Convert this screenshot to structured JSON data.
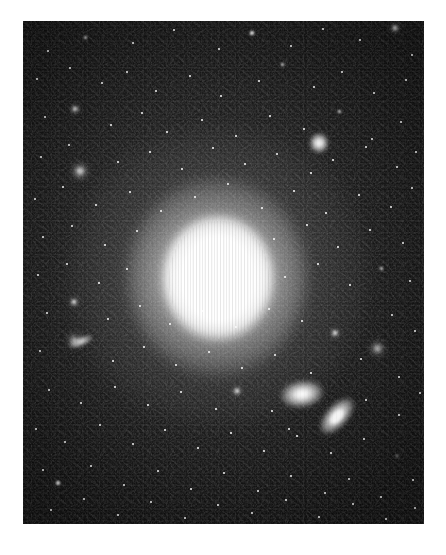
{
  "image": {
    "kind": "astronomical-photograph",
    "subject": "bright elliptical galaxy with companion galaxies in a dense star field",
    "canvas": {
      "width": 446,
      "height": 555,
      "background_color": "#ffffff"
    },
    "plate": {
      "x": 23,
      "y": 21,
      "width": 401,
      "height": 503,
      "background_color": "#121212",
      "sky_color": "#232323",
      "noise": "heavy photographic grain with vertical CCD column striping"
    },
    "colors": {
      "paper_white": "#ffffff",
      "sky_dark": "#121212",
      "sky_mid": "#2e2e2e",
      "star_white": "#ffffff",
      "core_white": "#ffffff"
    }
  },
  "objects": {
    "primary_galaxy": {
      "name": "central-elliptical-galaxy",
      "type": "elliptical",
      "center_x": 195,
      "center_y": 258,
      "core_radius": 44,
      "halo_radius": 150,
      "peak_brightness": "saturated",
      "artifact": "vertical saturation bleed stripes across core"
    },
    "companions": [
      {
        "name": "companion-galaxy-upper",
        "type": "lenticular",
        "center_x": 279,
        "center_y": 373,
        "semi_major": 21,
        "semi_minor": 13,
        "angle_deg": -8
      },
      {
        "name": "companion-galaxy-lower",
        "type": "edge-on-spiral",
        "center_x": 314,
        "center_y": 395,
        "semi_major": 22,
        "semi_minor": 11,
        "angle_deg": -48
      },
      {
        "name": "companion-galaxy-left-edge",
        "type": "edge-on",
        "center_x": 58,
        "center_y": 320,
        "semi_major": 12,
        "semi_minor": 5,
        "angle_deg": -22
      },
      {
        "name": "companion-galaxy-upper-right",
        "type": "compact",
        "center_x": 296,
        "center_y": 122,
        "semi_major": 9,
        "semi_minor": 10,
        "angle_deg": 0
      }
    ]
  },
  "chart_data": {
    "type": "scatter",
    "title": "",
    "xlabel": "",
    "ylabel": "",
    "xlim": [
      0,
      401
    ],
    "ylim": [
      0,
      503
    ],
    "grid": false,
    "legend": "none",
    "note": "Star field point sources. x,y are plate-relative pixels; r is rendered radius in px; b is brightness class 1-4.",
    "stars": [
      {
        "x": 25,
        "y": 30,
        "r": 1.2,
        "b": 1
      },
      {
        "x": 62,
        "y": 16,
        "r": 1.5,
        "b": 2
      },
      {
        "x": 110,
        "y": 22,
        "r": 1.1,
        "b": 1
      },
      {
        "x": 151,
        "y": 9,
        "r": 1.3,
        "b": 1
      },
      {
        "x": 196,
        "y": 28,
        "r": 1.0,
        "b": 1
      },
      {
        "x": 229,
        "y": 12,
        "r": 1.6,
        "b": 2
      },
      {
        "x": 268,
        "y": 25,
        "r": 1.2,
        "b": 1
      },
      {
        "x": 300,
        "y": 8,
        "r": 1.1,
        "b": 1
      },
      {
        "x": 337,
        "y": 19,
        "r": 1.4,
        "b": 1
      },
      {
        "x": 372,
        "y": 7,
        "r": 2.0,
        "b": 3
      },
      {
        "x": 389,
        "y": 34,
        "r": 1.2,
        "b": 1
      },
      {
        "x": 14,
        "y": 58,
        "r": 1.3,
        "b": 1
      },
      {
        "x": 47,
        "y": 47,
        "r": 1.1,
        "b": 1
      },
      {
        "x": 79,
        "y": 62,
        "r": 1.0,
        "b": 1
      },
      {
        "x": 104,
        "y": 51,
        "r": 1.4,
        "b": 1
      },
      {
        "x": 133,
        "y": 70,
        "r": 1.2,
        "b": 1
      },
      {
        "x": 167,
        "y": 55,
        "r": 1.1,
        "b": 1
      },
      {
        "x": 198,
        "y": 75,
        "r": 1.3,
        "b": 1
      },
      {
        "x": 236,
        "y": 60,
        "r": 1.0,
        "b": 1
      },
      {
        "x": 259,
        "y": 43,
        "r": 1.5,
        "b": 2
      },
      {
        "x": 291,
        "y": 66,
        "r": 1.2,
        "b": 1
      },
      {
        "x": 319,
        "y": 51,
        "r": 1.1,
        "b": 1
      },
      {
        "x": 351,
        "y": 72,
        "r": 1.3,
        "b": 1
      },
      {
        "x": 383,
        "y": 59,
        "r": 1.0,
        "b": 1
      },
      {
        "x": 22,
        "y": 96,
        "r": 1.1,
        "b": 1
      },
      {
        "x": 52,
        "y": 88,
        "r": 2.1,
        "b": 3
      },
      {
        "x": 88,
        "y": 104,
        "r": 1.2,
        "b": 1
      },
      {
        "x": 119,
        "y": 92,
        "r": 1.4,
        "b": 1
      },
      {
        "x": 144,
        "y": 111,
        "r": 1.0,
        "b": 1
      },
      {
        "x": 179,
        "y": 99,
        "r": 1.2,
        "b": 1
      },
      {
        "x": 213,
        "y": 115,
        "r": 1.1,
        "b": 1
      },
      {
        "x": 247,
        "y": 95,
        "r": 1.3,
        "b": 1
      },
      {
        "x": 281,
        "y": 108,
        "r": 1.0,
        "b": 1
      },
      {
        "x": 316,
        "y": 90,
        "r": 1.5,
        "b": 2
      },
      {
        "x": 349,
        "y": 118,
        "r": 1.2,
        "b": 1
      },
      {
        "x": 378,
        "y": 101,
        "r": 1.1,
        "b": 1
      },
      {
        "x": 18,
        "y": 136,
        "r": 1.3,
        "b": 1
      },
      {
        "x": 46,
        "y": 124,
        "r": 1.1,
        "b": 1
      },
      {
        "x": 57,
        "y": 150,
        "r": 2.6,
        "b": 4
      },
      {
        "x": 95,
        "y": 141,
        "r": 1.2,
        "b": 1
      },
      {
        "x": 127,
        "y": 131,
        "r": 1.0,
        "b": 1
      },
      {
        "x": 159,
        "y": 148,
        "r": 1.3,
        "b": 1
      },
      {
        "x": 190,
        "y": 127,
        "r": 1.1,
        "b": 1
      },
      {
        "x": 222,
        "y": 143,
        "r": 1.2,
        "b": 1
      },
      {
        "x": 254,
        "y": 133,
        "r": 1.0,
        "b": 1
      },
      {
        "x": 288,
        "y": 152,
        "r": 1.4,
        "b": 1
      },
      {
        "x": 310,
        "y": 139,
        "r": 1.1,
        "b": 1
      },
      {
        "x": 343,
        "y": 126,
        "r": 1.3,
        "b": 1
      },
      {
        "x": 374,
        "y": 146,
        "r": 1.0,
        "b": 1
      },
      {
        "x": 393,
        "y": 131,
        "r": 1.2,
        "b": 1
      },
      {
        "x": 12,
        "y": 178,
        "r": 1.1,
        "b": 1
      },
      {
        "x": 40,
        "y": 166,
        "r": 1.3,
        "b": 1
      },
      {
        "x": 73,
        "y": 184,
        "r": 1.0,
        "b": 1
      },
      {
        "x": 107,
        "y": 171,
        "r": 1.2,
        "b": 1
      },
      {
        "x": 138,
        "y": 190,
        "r": 1.1,
        "b": 1
      },
      {
        "x": 172,
        "y": 176,
        "r": 1.0,
        "b": 1
      },
      {
        "x": 205,
        "y": 163,
        "r": 1.2,
        "b": 1
      },
      {
        "x": 239,
        "y": 187,
        "r": 1.1,
        "b": 1
      },
      {
        "x": 271,
        "y": 170,
        "r": 1.4,
        "b": 1
      },
      {
        "x": 303,
        "y": 192,
        "r": 1.0,
        "b": 1
      },
      {
        "x": 336,
        "y": 174,
        "r": 1.3,
        "b": 1
      },
      {
        "x": 368,
        "y": 186,
        "r": 1.1,
        "b": 1
      },
      {
        "x": 389,
        "y": 167,
        "r": 1.2,
        "b": 1
      },
      {
        "x": 20,
        "y": 216,
        "r": 1.2,
        "b": 1
      },
      {
        "x": 49,
        "y": 205,
        "r": 1.0,
        "b": 1
      },
      {
        "x": 82,
        "y": 224,
        "r": 1.3,
        "b": 1
      },
      {
        "x": 114,
        "y": 210,
        "r": 1.1,
        "b": 1
      },
      {
        "x": 251,
        "y": 218,
        "r": 1.2,
        "b": 1
      },
      {
        "x": 284,
        "y": 204,
        "r": 1.0,
        "b": 1
      },
      {
        "x": 315,
        "y": 226,
        "r": 1.4,
        "b": 1
      },
      {
        "x": 347,
        "y": 209,
        "r": 1.1,
        "b": 1
      },
      {
        "x": 380,
        "y": 222,
        "r": 1.3,
        "b": 1
      },
      {
        "x": 15,
        "y": 254,
        "r": 1.1,
        "b": 1
      },
      {
        "x": 44,
        "y": 243,
        "r": 1.2,
        "b": 1
      },
      {
        "x": 76,
        "y": 262,
        "r": 1.0,
        "b": 1
      },
      {
        "x": 104,
        "y": 248,
        "r": 1.3,
        "b": 1
      },
      {
        "x": 262,
        "y": 256,
        "r": 1.1,
        "b": 1
      },
      {
        "x": 295,
        "y": 243,
        "r": 1.2,
        "b": 1
      },
      {
        "x": 327,
        "y": 264,
        "r": 1.0,
        "b": 1
      },
      {
        "x": 358,
        "y": 247,
        "r": 1.5,
        "b": 2
      },
      {
        "x": 387,
        "y": 260,
        "r": 1.1,
        "b": 1
      },
      {
        "x": 24,
        "y": 292,
        "r": 1.3,
        "b": 1
      },
      {
        "x": 51,
        "y": 281,
        "r": 1.9,
        "b": 3
      },
      {
        "x": 85,
        "y": 298,
        "r": 1.0,
        "b": 1
      },
      {
        "x": 117,
        "y": 285,
        "r": 1.2,
        "b": 1
      },
      {
        "x": 147,
        "y": 303,
        "r": 1.1,
        "b": 1
      },
      {
        "x": 179,
        "y": 290,
        "r": 1.0,
        "b": 1
      },
      {
        "x": 213,
        "y": 306,
        "r": 1.3,
        "b": 1
      },
      {
        "x": 246,
        "y": 288,
        "r": 1.1,
        "b": 1
      },
      {
        "x": 279,
        "y": 300,
        "r": 1.2,
        "b": 1
      },
      {
        "x": 312,
        "y": 312,
        "r": 2.3,
        "b": 3
      },
      {
        "x": 354,
        "y": 327,
        "r": 2.5,
        "b": 4
      },
      {
        "x": 369,
        "y": 294,
        "r": 1.2,
        "b": 1
      },
      {
        "x": 392,
        "y": 310,
        "r": 1.1,
        "b": 1
      },
      {
        "x": 17,
        "y": 330,
        "r": 1.2,
        "b": 1
      },
      {
        "x": 51,
        "y": 319,
        "r": 2.4,
        "b": 4
      },
      {
        "x": 90,
        "y": 340,
        "r": 1.1,
        "b": 1
      },
      {
        "x": 121,
        "y": 326,
        "r": 1.3,
        "b": 1
      },
      {
        "x": 153,
        "y": 344,
        "r": 1.0,
        "b": 1
      },
      {
        "x": 186,
        "y": 331,
        "r": 1.2,
        "b": 1
      },
      {
        "x": 219,
        "y": 347,
        "r": 1.1,
        "b": 1
      },
      {
        "x": 252,
        "y": 334,
        "r": 1.0,
        "b": 1
      },
      {
        "x": 288,
        "y": 352,
        "r": 1.3,
        "b": 1
      },
      {
        "x": 338,
        "y": 338,
        "r": 1.1,
        "b": 1
      },
      {
        "x": 376,
        "y": 356,
        "r": 1.2,
        "b": 1
      },
      {
        "x": 26,
        "y": 369,
        "r": 1.1,
        "b": 1
      },
      {
        "x": 58,
        "y": 382,
        "r": 1.3,
        "b": 1
      },
      {
        "x": 92,
        "y": 366,
        "r": 1.0,
        "b": 1
      },
      {
        "x": 125,
        "y": 384,
        "r": 1.2,
        "b": 1
      },
      {
        "x": 158,
        "y": 371,
        "r": 1.1,
        "b": 1
      },
      {
        "x": 193,
        "y": 388,
        "r": 1.0,
        "b": 1
      },
      {
        "x": 214,
        "y": 370,
        "r": 2.0,
        "b": 3
      },
      {
        "x": 249,
        "y": 390,
        "r": 1.2,
        "b": 1
      },
      {
        "x": 266,
        "y": 408,
        "r": 1.1,
        "b": 1
      },
      {
        "x": 343,
        "y": 379,
        "r": 1.3,
        "b": 1
      },
      {
        "x": 376,
        "y": 394,
        "r": 1.0,
        "b": 1
      },
      {
        "x": 397,
        "y": 372,
        "r": 1.2,
        "b": 1
      },
      {
        "x": 13,
        "y": 408,
        "r": 1.2,
        "b": 1
      },
      {
        "x": 42,
        "y": 421,
        "r": 1.0,
        "b": 1
      },
      {
        "x": 77,
        "y": 404,
        "r": 1.3,
        "b": 1
      },
      {
        "x": 110,
        "y": 423,
        "r": 1.1,
        "b": 1
      },
      {
        "x": 142,
        "y": 409,
        "r": 1.0,
        "b": 1
      },
      {
        "x": 175,
        "y": 427,
        "r": 1.2,
        "b": 1
      },
      {
        "x": 208,
        "y": 412,
        "r": 1.1,
        "b": 1
      },
      {
        "x": 241,
        "y": 430,
        "r": 1.3,
        "b": 1
      },
      {
        "x": 274,
        "y": 415,
        "r": 1.0,
        "b": 1
      },
      {
        "x": 308,
        "y": 432,
        "r": 1.2,
        "b": 1
      },
      {
        "x": 341,
        "y": 418,
        "r": 1.1,
        "b": 1
      },
      {
        "x": 374,
        "y": 435,
        "r": 1.4,
        "b": 2
      },
      {
        "x": 20,
        "y": 449,
        "r": 1.1,
        "b": 1
      },
      {
        "x": 35,
        "y": 462,
        "r": 1.7,
        "b": 2
      },
      {
        "x": 68,
        "y": 445,
        "r": 1.2,
        "b": 1
      },
      {
        "x": 101,
        "y": 464,
        "r": 1.0,
        "b": 1
      },
      {
        "x": 135,
        "y": 450,
        "r": 1.3,
        "b": 1
      },
      {
        "x": 168,
        "y": 468,
        "r": 1.1,
        "b": 1
      },
      {
        "x": 201,
        "y": 452,
        "r": 1.0,
        "b": 1
      },
      {
        "x": 235,
        "y": 470,
        "r": 1.2,
        "b": 1
      },
      {
        "x": 268,
        "y": 455,
        "r": 1.1,
        "b": 1
      },
      {
        "x": 302,
        "y": 472,
        "r": 1.3,
        "b": 1
      },
      {
        "x": 326,
        "y": 458,
        "r": 1.0,
        "b": 1
      },
      {
        "x": 358,
        "y": 476,
        "r": 1.2,
        "b": 1
      },
      {
        "x": 390,
        "y": 459,
        "r": 1.1,
        "b": 1
      },
      {
        "x": 28,
        "y": 489,
        "r": 1.2,
        "b": 1
      },
      {
        "x": 61,
        "y": 478,
        "r": 1.0,
        "b": 1
      },
      {
        "x": 95,
        "y": 494,
        "r": 1.3,
        "b": 1
      },
      {
        "x": 128,
        "y": 481,
        "r": 1.1,
        "b": 1
      },
      {
        "x": 162,
        "y": 497,
        "r": 1.0,
        "b": 1
      },
      {
        "x": 195,
        "y": 484,
        "r": 1.2,
        "b": 1
      },
      {
        "x": 229,
        "y": 492,
        "r": 1.1,
        "b": 1
      },
      {
        "x": 263,
        "y": 479,
        "r": 1.3,
        "b": 1
      },
      {
        "x": 296,
        "y": 496,
        "r": 1.0,
        "b": 1
      },
      {
        "x": 330,
        "y": 483,
        "r": 1.2,
        "b": 1
      },
      {
        "x": 363,
        "y": 498,
        "r": 1.1,
        "b": 1
      },
      {
        "x": 392,
        "y": 487,
        "r": 1.0,
        "b": 1
      }
    ]
  }
}
